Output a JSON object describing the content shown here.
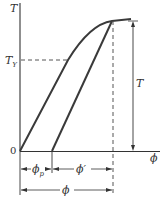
{
  "diagram": {
    "axes": {
      "y_label": "T",
      "x_label": "ϕ",
      "origin_label": "0"
    },
    "levels": {
      "yield_label": "T",
      "yield_sub": "Y",
      "total_label": "T"
    },
    "dimensions": {
      "plastic_label": "ϕ",
      "plastic_sub": "p",
      "elastic_label": "ϕ′",
      "total_label": "ϕ"
    },
    "colors": {
      "curve": "#3a3a3a",
      "axis": "#333333",
      "dash": "#555555"
    }
  }
}
